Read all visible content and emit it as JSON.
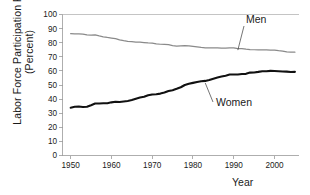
{
  "chart_data": {
    "type": "line",
    "title": "",
    "xlabel": "Year",
    "ylabel": "Labor Force Participation Rate (Percent)",
    "ylabel_line1": "Labor Force Participation Rate",
    "ylabel_line2": "(Percent)",
    "xlim": [
      1948,
      2006
    ],
    "ylim": [
      0,
      100
    ],
    "grid": false,
    "legend_position": "inline-annotations",
    "ytick_labels": [
      "0",
      "10",
      "20",
      "30",
      "40",
      "50",
      "60",
      "70",
      "80",
      "90",
      "100"
    ],
    "ytick_values": [
      0,
      10,
      20,
      30,
      40,
      50,
      60,
      70,
      80,
      90,
      100
    ],
    "xtick_labels": [
      "1950",
      "1960",
      "1970",
      "1980",
      "1990",
      "2000"
    ],
    "xtick_values": [
      1950,
      1960,
      1970,
      1980,
      1990,
      2000
    ],
    "annotations": [
      {
        "text": "Men",
        "series": "Men"
      },
      {
        "text": "Women",
        "series": "Women"
      }
    ],
    "colors": {
      "men": "#8a8a8a",
      "women": "#111111",
      "axis": "#9a9a9a",
      "text": "#1a1a1a",
      "background": "#ffffff"
    },
    "x": [
      1950,
      1951,
      1952,
      1953,
      1954,
      1955,
      1956,
      1957,
      1958,
      1959,
      1960,
      1961,
      1962,
      1963,
      1964,
      1965,
      1966,
      1967,
      1968,
      1969,
      1970,
      1971,
      1972,
      1973,
      1974,
      1975,
      1976,
      1977,
      1978,
      1979,
      1980,
      1981,
      1982,
      1983,
      1984,
      1985,
      1986,
      1987,
      1988,
      1989,
      1990,
      1991,
      1992,
      1993,
      1994,
      1995,
      1996,
      1997,
      1998,
      1999,
      2000,
      2001,
      2002,
      2003,
      2004,
      2005
    ],
    "series": [
      {
        "name": "Men",
        "values": [
          86.4,
          86.3,
          86.3,
          86.0,
          85.5,
          85.4,
          85.5,
          84.8,
          84.2,
          83.7,
          83.3,
          82.9,
          82.0,
          81.4,
          81.0,
          80.7,
          80.4,
          80.4,
          80.1,
          79.8,
          79.7,
          79.1,
          78.9,
          78.8,
          78.7,
          77.9,
          77.5,
          77.7,
          77.9,
          77.8,
          77.4,
          77.0,
          76.6,
          76.4,
          76.4,
          76.3,
          76.3,
          76.2,
          76.2,
          76.4,
          76.4,
          75.8,
          75.8,
          75.4,
          75.1,
          75.0,
          74.9,
          75.0,
          74.9,
          74.7,
          74.8,
          74.4,
          74.1,
          73.5,
          73.3,
          73.3
        ]
      },
      {
        "name": "Women",
        "values": [
          33.9,
          34.6,
          34.7,
          34.4,
          34.6,
          35.7,
          36.9,
          36.9,
          37.1,
          37.1,
          37.7,
          38.1,
          37.9,
          38.3,
          38.7,
          39.3,
          40.3,
          41.1,
          41.6,
          42.7,
          43.3,
          43.4,
          43.9,
          44.7,
          45.7,
          46.3,
          47.3,
          48.4,
          50.0,
          50.9,
          51.5,
          52.1,
          52.6,
          52.9,
          53.6,
          54.5,
          55.3,
          56.0,
          56.6,
          57.4,
          57.5,
          57.4,
          57.8,
          57.9,
          58.8,
          58.9,
          59.3,
          59.8,
          59.8,
          60.0,
          59.9,
          59.8,
          59.6,
          59.5,
          59.2,
          59.3
        ]
      }
    ]
  }
}
